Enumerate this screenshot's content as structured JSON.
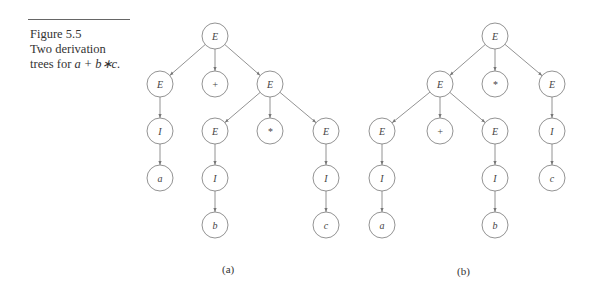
{
  "caption": {
    "line1": "Figure 5.5",
    "line2": "Two derivation",
    "line3_prefix": "trees for ",
    "line3_expr": "a + b∗c."
  },
  "trees": [
    {
      "label": "(a)",
      "label_pos": [
        230,
        270
      ],
      "nodes": [
        {
          "id": "a0",
          "text": "E",
          "x": 215,
          "y": 36
        },
        {
          "id": "a1",
          "text": "E",
          "x": 160,
          "y": 84
        },
        {
          "id": "a2",
          "text": "+",
          "x": 215,
          "y": 84
        },
        {
          "id": "a3",
          "text": "E",
          "x": 270,
          "y": 84
        },
        {
          "id": "a4",
          "text": "I",
          "x": 160,
          "y": 131
        },
        {
          "id": "a5",
          "text": "a",
          "x": 160,
          "y": 178
        },
        {
          "id": "a6",
          "text": "E",
          "x": 215,
          "y": 131
        },
        {
          "id": "a7",
          "text": "*",
          "x": 270,
          "y": 131
        },
        {
          "id": "a8",
          "text": "E",
          "x": 326,
          "y": 131
        },
        {
          "id": "a9",
          "text": "I",
          "x": 215,
          "y": 178
        },
        {
          "id": "a10",
          "text": "b",
          "x": 215,
          "y": 225
        },
        {
          "id": "a11",
          "text": "I",
          "x": 326,
          "y": 178
        },
        {
          "id": "a12",
          "text": "c",
          "x": 326,
          "y": 225
        }
      ],
      "edges": [
        [
          "a0",
          "a1"
        ],
        [
          "a0",
          "a2"
        ],
        [
          "a0",
          "a3"
        ],
        [
          "a1",
          "a4"
        ],
        [
          "a4",
          "a5"
        ],
        [
          "a3",
          "a6"
        ],
        [
          "a3",
          "a7"
        ],
        [
          "a3",
          "a8"
        ],
        [
          "a6",
          "a9"
        ],
        [
          "a9",
          "a10"
        ],
        [
          "a8",
          "a11"
        ],
        [
          "a11",
          "a12"
        ]
      ]
    },
    {
      "label": "(b)",
      "label_pos": [
        465,
        272
      ],
      "nodes": [
        {
          "id": "b0",
          "text": "E",
          "x": 495,
          "y": 36
        },
        {
          "id": "b1",
          "text": "E",
          "x": 440,
          "y": 84
        },
        {
          "id": "b2",
          "text": "*",
          "x": 495,
          "y": 84
        },
        {
          "id": "b3",
          "text": "E",
          "x": 552,
          "y": 84
        },
        {
          "id": "b4",
          "text": "E",
          "x": 382,
          "y": 131
        },
        {
          "id": "b5",
          "text": "+",
          "x": 440,
          "y": 131
        },
        {
          "id": "b6",
          "text": "E",
          "x": 495,
          "y": 131
        },
        {
          "id": "b7",
          "text": "I",
          "x": 552,
          "y": 131
        },
        {
          "id": "b8",
          "text": "I",
          "x": 382,
          "y": 178
        },
        {
          "id": "b9",
          "text": "a",
          "x": 382,
          "y": 225
        },
        {
          "id": "b10",
          "text": "I",
          "x": 495,
          "y": 178
        },
        {
          "id": "b11",
          "text": "b",
          "x": 495,
          "y": 225
        },
        {
          "id": "b12",
          "text": "c",
          "x": 552,
          "y": 178
        }
      ],
      "edges": [
        [
          "b0",
          "b1"
        ],
        [
          "b0",
          "b2"
        ],
        [
          "b0",
          "b3"
        ],
        [
          "b1",
          "b4"
        ],
        [
          "b1",
          "b5"
        ],
        [
          "b1",
          "b6"
        ],
        [
          "b3",
          "b7"
        ],
        [
          "b7",
          "b12"
        ],
        [
          "b4",
          "b8"
        ],
        [
          "b8",
          "b9"
        ],
        [
          "b6",
          "b10"
        ],
        [
          "b10",
          "b11"
        ]
      ]
    }
  ],
  "node_radius": 13
}
